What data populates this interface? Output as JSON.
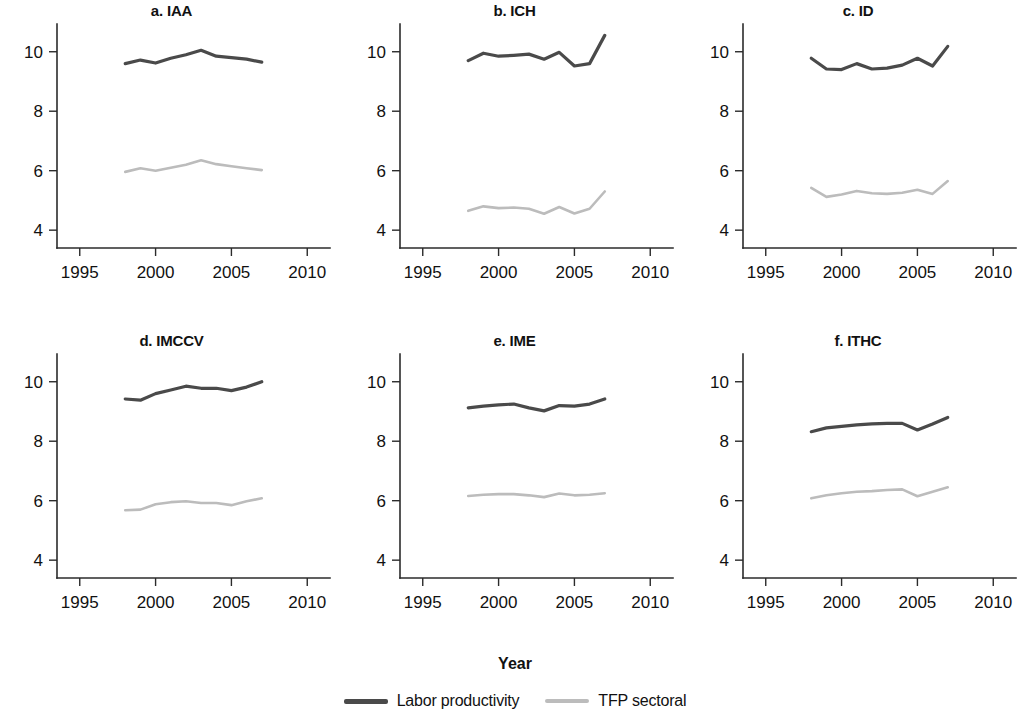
{
  "figure": {
    "xlabel": "Year",
    "legend": [
      {
        "label": "Labor productivity",
        "color": "#4a4a4a"
      },
      {
        "label": "TFP sectoral",
        "color": "#bcbcbc"
      }
    ]
  },
  "chart_data": [
    {
      "type": "line",
      "title": "a. IAA",
      "xlabel": "Year",
      "ylabel": "",
      "xlim": [
        1993.5,
        2011.5
      ],
      "ylim": [
        3.4,
        11.0
      ],
      "xticks": [
        1995,
        2000,
        2005,
        2010
      ],
      "yticks": [
        4,
        6,
        8,
        10
      ],
      "grid": false,
      "x": [
        1998,
        1999,
        2000,
        2001,
        2002,
        2003,
        2004,
        2005,
        2006,
        2007
      ],
      "series": [
        {
          "name": "Labor productivity",
          "color": "#4a4a4a",
          "values": [
            9.6,
            9.72,
            9.62,
            9.78,
            9.9,
            10.05,
            9.85,
            9.8,
            9.75,
            9.65
          ]
        },
        {
          "name": "TFP sectoral",
          "color": "#bcbcbc",
          "values": [
            5.96,
            6.08,
            6.0,
            6.1,
            6.2,
            6.35,
            6.22,
            6.15,
            6.08,
            6.02
          ]
        }
      ]
    },
    {
      "type": "line",
      "title": "b. ICH",
      "xlabel": "Year",
      "ylabel": "",
      "xlim": [
        1993.5,
        2011.5
      ],
      "ylim": [
        3.4,
        11.0
      ],
      "xticks": [
        1995,
        2000,
        2005,
        2010
      ],
      "yticks": [
        4,
        6,
        8,
        10
      ],
      "grid": false,
      "x": [
        1998,
        1999,
        2000,
        2001,
        2002,
        2003,
        2004,
        2005,
        2006,
        2007
      ],
      "series": [
        {
          "name": "Labor productivity",
          "color": "#4a4a4a",
          "values": [
            9.7,
            9.95,
            9.85,
            9.88,
            9.92,
            9.75,
            9.98,
            9.52,
            9.6,
            10.55
          ]
        },
        {
          "name": "TFP sectoral",
          "color": "#bcbcbc",
          "values": [
            4.65,
            4.8,
            4.74,
            4.76,
            4.72,
            4.55,
            4.78,
            4.56,
            4.72,
            5.3
          ]
        }
      ]
    },
    {
      "type": "line",
      "title": "c. ID",
      "xlabel": "Year",
      "ylabel": "",
      "xlim": [
        1993.5,
        2011.5
      ],
      "ylim": [
        3.4,
        11.0
      ],
      "xticks": [
        1995,
        2000,
        2005,
        2010
      ],
      "yticks": [
        4,
        6,
        8,
        10
      ],
      "grid": false,
      "x": [
        1998,
        1999,
        2000,
        2001,
        2002,
        2003,
        2004,
        2005,
        2006,
        2007
      ],
      "series": [
        {
          "name": "Labor productivity",
          "color": "#4a4a4a",
          "values": [
            9.78,
            9.42,
            9.4,
            9.6,
            9.42,
            9.45,
            9.55,
            9.78,
            9.52,
            10.18
          ]
        },
        {
          "name": "TFP sectoral",
          "color": "#bcbcbc",
          "values": [
            5.42,
            5.12,
            5.2,
            5.32,
            5.24,
            5.22,
            5.26,
            5.36,
            5.22,
            5.65
          ]
        }
      ]
    },
    {
      "type": "line",
      "title": "d. IMCCV",
      "xlabel": "Year",
      "ylabel": "",
      "xlim": [
        1993.5,
        2011.5
      ],
      "ylim": [
        3.4,
        11.0
      ],
      "xticks": [
        1995,
        2000,
        2005,
        2010
      ],
      "yticks": [
        4,
        6,
        8,
        10
      ],
      "grid": false,
      "x": [
        1998,
        1999,
        2000,
        2001,
        2002,
        2003,
        2004,
        2005,
        2006,
        2007
      ],
      "series": [
        {
          "name": "Labor productivity",
          "color": "#4a4a4a",
          "values": [
            9.42,
            9.38,
            9.6,
            9.72,
            9.85,
            9.78,
            9.78,
            9.7,
            9.82,
            10.0
          ]
        },
        {
          "name": "TFP sectoral",
          "color": "#bcbcbc",
          "values": [
            5.68,
            5.7,
            5.88,
            5.95,
            5.98,
            5.92,
            5.92,
            5.85,
            5.98,
            6.08
          ]
        }
      ]
    },
    {
      "type": "line",
      "title": "e. IME",
      "xlabel": "Year",
      "ylabel": "",
      "xlim": [
        1993.5,
        2011.5
      ],
      "ylim": [
        3.4,
        11.0
      ],
      "xticks": [
        1995,
        2000,
        2005,
        2010
      ],
      "yticks": [
        4,
        6,
        8,
        10
      ],
      "grid": false,
      "x": [
        1998,
        1999,
        2000,
        2001,
        2002,
        2003,
        2004,
        2005,
        2006,
        2007
      ],
      "series": [
        {
          "name": "Labor productivity",
          "color": "#4a4a4a",
          "values": [
            9.12,
            9.18,
            9.22,
            9.25,
            9.12,
            9.02,
            9.2,
            9.18,
            9.25,
            9.42
          ]
        },
        {
          "name": "TFP sectoral",
          "color": "#bcbcbc",
          "values": [
            6.16,
            6.2,
            6.22,
            6.22,
            6.18,
            6.12,
            6.24,
            6.18,
            6.2,
            6.25
          ]
        }
      ]
    },
    {
      "type": "line",
      "title": "f. ITHC",
      "xlabel": "Year",
      "ylabel": "",
      "xlim": [
        1993.5,
        2011.5
      ],
      "ylim": [
        3.4,
        11.0
      ],
      "xticks": [
        1995,
        2000,
        2005,
        2010
      ],
      "yticks": [
        4,
        6,
        8,
        10
      ],
      "grid": false,
      "x": [
        1998,
        1999,
        2000,
        2001,
        2002,
        2003,
        2004,
        2005,
        2006,
        2007
      ],
      "series": [
        {
          "name": "Labor productivity",
          "color": "#4a4a4a",
          "values": [
            8.32,
            8.45,
            8.5,
            8.55,
            8.58,
            8.6,
            8.6,
            8.38,
            8.58,
            8.8
          ]
        },
        {
          "name": "TFP sectoral",
          "color": "#bcbcbc",
          "values": [
            6.08,
            6.18,
            6.25,
            6.3,
            6.32,
            6.36,
            6.38,
            6.15,
            6.3,
            6.45
          ]
        }
      ]
    }
  ]
}
